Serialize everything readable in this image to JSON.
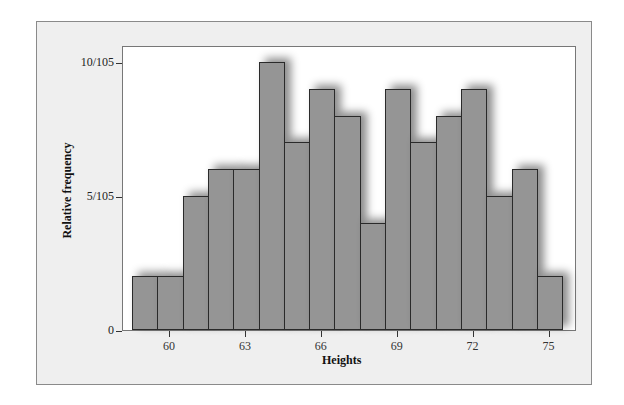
{
  "chart_data": {
    "type": "bar",
    "title": "",
    "xlabel": "Heights",
    "ylabel": "Relative frequency",
    "categories": [
      59,
      60,
      61,
      62,
      63,
      64,
      65,
      66,
      67,
      68,
      69,
      70,
      71,
      72,
      73,
      74,
      75
    ],
    "values": [
      2,
      2,
      5,
      6,
      6,
      10,
      7,
      9,
      8,
      4,
      9,
      7,
      8,
      9,
      5,
      6,
      2
    ],
    "value_denominator": 105,
    "x_ticks": [
      "60",
      "63",
      "66",
      "69",
      "72",
      "75"
    ],
    "y_ticks": [
      "0",
      "5/105",
      "10/105"
    ],
    "ylim": [
      0,
      10.6
    ],
    "grid": false,
    "legend": null
  },
  "colors": {
    "bar": "#959595",
    "panel": "#efefef",
    "plot": "#ffffff"
  }
}
